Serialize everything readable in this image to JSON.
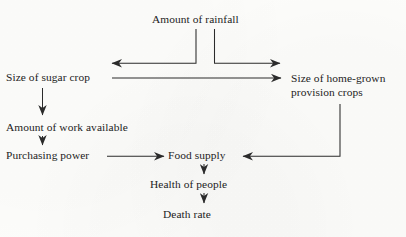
{
  "page": {
    "width": 406,
    "height": 237,
    "background_color": "#fdfdfb",
    "ink_color": "#232323"
  },
  "running_head": {
    "title": "",
    "folio": "",
    "note": "clipped running header at top edge, illegible"
  },
  "diagram": {
    "type": "flowchart",
    "nodes": [
      {
        "id": "rainfall",
        "label": "Amount of rainfall",
        "x": 152,
        "y": 13,
        "lines": [
          "Amount of rainfall"
        ]
      },
      {
        "id": "sugar_crop",
        "label": "Size of sugar crop",
        "x": 6,
        "y": 71,
        "lines": [
          "Size of sugar crop"
        ]
      },
      {
        "id": "provision_crops",
        "label": "Size of home-grown provision crops",
        "x": 291,
        "y": 71,
        "lines": [
          "Size of home-grown",
          "provision crops"
        ]
      },
      {
        "id": "work_available",
        "label": "Amount of work available",
        "x": 6,
        "y": 121,
        "lines": [
          "Amount of work available"
        ]
      },
      {
        "id": "purchasing_power",
        "label": "Purchasing power",
        "x": 6,
        "y": 149,
        "lines": [
          "Purchasing power"
        ]
      },
      {
        "id": "food_supply",
        "label": "Food supply",
        "x": 168,
        "y": 149,
        "lines": [
          "Food supply"
        ]
      },
      {
        "id": "health_of_people",
        "label": "Health of people",
        "x": 150,
        "y": 178,
        "lines": [
          "Health of people"
        ]
      },
      {
        "id": "death_rate",
        "label": "Death rate",
        "x": 163,
        "y": 208,
        "lines": [
          "Death rate"
        ]
      }
    ],
    "edges": [
      {
        "id": "rainfall-to-sugar-crop",
        "from": "rainfall",
        "to": "sugar_crop",
        "style": "elbow-left"
      },
      {
        "id": "rainfall-to-provision-crops",
        "from": "rainfall",
        "to": "provision_crops",
        "style": "elbow-right"
      },
      {
        "id": "sugar-crop-to-provision-crops",
        "from": "sugar_crop",
        "to": "provision_crops",
        "style": "horizontal"
      },
      {
        "id": "sugar-crop-to-work-available",
        "from": "sugar_crop",
        "to": "work_available",
        "style": "vertical"
      },
      {
        "id": "work-available-to-purchasing-power",
        "from": "work_available",
        "to": "purchasing_power",
        "style": "vertical"
      },
      {
        "id": "purchasing-power-to-food-supply",
        "from": "purchasing_power",
        "to": "food_supply",
        "style": "horizontal"
      },
      {
        "id": "provision-crops-to-food-supply",
        "from": "provision_crops",
        "to": "food_supply",
        "style": "elbow-down-left"
      },
      {
        "id": "food-supply-to-health",
        "from": "food_supply",
        "to": "health_of_people",
        "style": "vertical"
      },
      {
        "id": "health-to-death-rate",
        "from": "health_of_people",
        "to": "death_rate",
        "style": "vertical"
      }
    ]
  }
}
